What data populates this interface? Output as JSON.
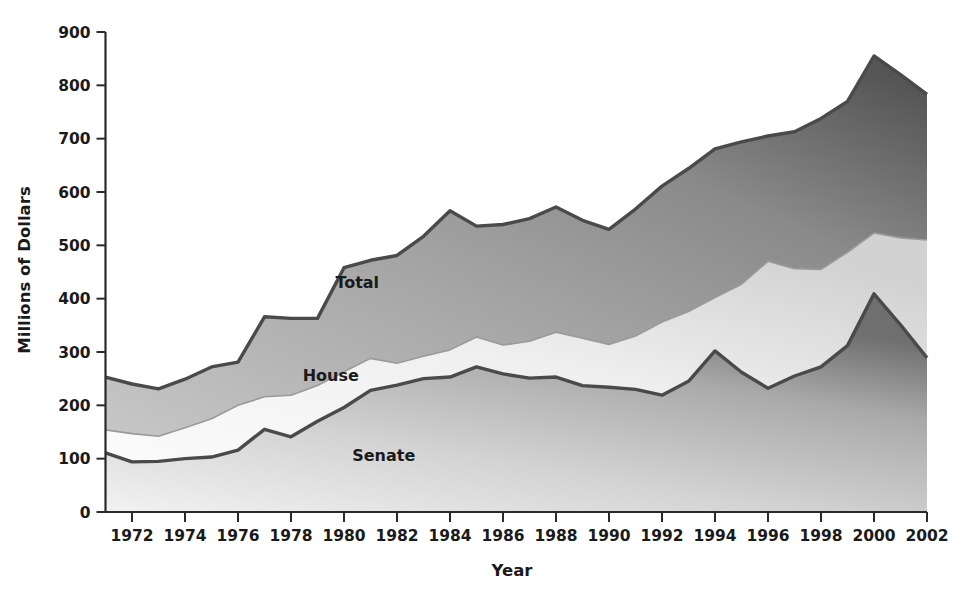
{
  "chart_data": {
    "type": "area",
    "title": "",
    "subtitle": "",
    "xlabel": "Year",
    "ylabel": "Millions of Dollars",
    "xlim": [
      1971,
      2002
    ],
    "ylim": [
      0,
      900
    ],
    "grid": false,
    "legend_position": "inline-annotations",
    "stacked": true,
    "x": [
      1971,
      1972,
      1973,
      1974,
      1975,
      1976,
      1977,
      1978,
      1979,
      1980,
      1981,
      1982,
      1983,
      1984,
      1985,
      1986,
      1987,
      1988,
      1989,
      1990,
      1991,
      1992,
      1993,
      1994,
      1995,
      1996,
      1997,
      1998,
      1999,
      2000,
      2001,
      2002
    ],
    "xticks": [
      1972,
      1974,
      1976,
      1978,
      1980,
      1982,
      1984,
      1986,
      1988,
      1990,
      1992,
      1994,
      1996,
      1998,
      2000,
      2002
    ],
    "xticklabels": [
      "1972",
      "1974",
      "1976",
      "1978",
      "1980",
      "1982",
      "1984",
      "1986",
      "1988",
      "1990",
      "1992",
      "1994",
      "1996",
      "1998",
      "2000",
      "2002"
    ],
    "yticks": [
      0,
      100,
      200,
      300,
      400,
      500,
      600,
      700,
      800,
      900
    ],
    "yticklabels": [
      "0",
      "100",
      "200",
      "300",
      "400",
      "500",
      "600",
      "700",
      "800",
      "900"
    ],
    "series": [
      {
        "name": "Senate",
        "label": "Senate",
        "cumulative": true,
        "color": "#b2b2b2",
        "line_color": "#4a4a4a",
        "values": [
          111,
          94,
          95,
          100,
          103,
          116,
          155,
          141,
          170,
          196,
          228,
          238,
          250,
          253,
          272,
          259,
          251,
          253,
          237,
          234,
          230,
          219,
          245,
          302,
          262,
          232,
          255,
          272,
          312,
          409,
          351,
          289
        ]
      },
      {
        "name": "House",
        "label": "House",
        "cumulative": true,
        "color": "#ececec",
        "line_color": "#9a9a9a",
        "values": [
          154,
          147,
          142,
          158,
          175,
          200,
          216,
          219,
          237,
          263,
          288,
          279,
          292,
          304,
          328,
          313,
          320,
          337,
          326,
          314,
          330,
          356,
          376,
          402,
          427,
          470,
          456,
          455,
          487,
          523,
          514,
          510
        ]
      },
      {
        "name": "Total",
        "label": "Total",
        "cumulative": true,
        "color": "#9a9a9a",
        "line_color": "#4a4a4a",
        "values": [
          253,
          240,
          231,
          249,
          272,
          281,
          366,
          363,
          363,
          458,
          472,
          481,
          517,
          565,
          536,
          539,
          550,
          572,
          547,
          530,
          568,
          611,
          644,
          681,
          694,
          705,
          713,
          738,
          770,
          855,
          820,
          783
        ]
      }
    ],
    "annotations": [
      {
        "text": "Total",
        "x": 1980.5,
        "y": 420,
        "name": "total-area-label"
      },
      {
        "text": "House",
        "x": 1979.5,
        "y": 245,
        "name": "house-area-label"
      },
      {
        "text": "Senate",
        "x": 1981.5,
        "y": 95,
        "name": "senate-area-label"
      }
    ]
  }
}
